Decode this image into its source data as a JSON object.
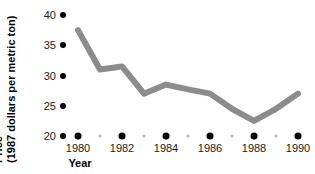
{
  "chart_data": {
    "type": "line",
    "title": "",
    "xlabel": "Year",
    "ylabel": "Price (1987 dollars per metric ton)",
    "ylabel_lines": [
      "Price",
      "(1987 dollars per metric ton)"
    ],
    "x": [
      1980,
      1981,
      1982,
      1983,
      1984,
      1985,
      1986,
      1987,
      1988,
      1989,
      1990
    ],
    "values": [
      37.5,
      31.0,
      31.5,
      27.0,
      28.5,
      27.7,
      27.0,
      24.5,
      22.5,
      24.5,
      27.0
    ],
    "series": [
      {
        "name": "Price",
        "values": [
          37.5,
          31.0,
          31.5,
          27.0,
          28.5,
          27.7,
          27.0,
          24.5,
          22.5,
          24.5,
          27.0
        ],
        "color": "#8c8c8c"
      }
    ],
    "xlim": [
      1979.5,
      1990.5
    ],
    "ylim": [
      20,
      40
    ],
    "yticks": [
      20,
      25,
      30,
      35,
      40
    ],
    "ytick_labels": [
      "20",
      "25",
      "30",
      "35",
      "40"
    ],
    "xticks": [
      1980,
      1981,
      1982,
      1983,
      1984,
      1985,
      1986,
      1987,
      1988,
      1989,
      1990
    ],
    "xtick_labels_major": [
      "1980",
      "1982",
      "1984",
      "1986",
      "1988",
      "1990"
    ],
    "xticks_major": [
      1980,
      1982,
      1984,
      1986,
      1988,
      1990
    ],
    "xticks_minor": [
      1981,
      1983,
      1985,
      1987,
      1989
    ],
    "grid": false,
    "legend": false,
    "legend_position": "none",
    "marker_style": "dot-ticks",
    "line_color": "#8c8c8c",
    "tick_color_major": "#000000",
    "tick_color_minor": "#b3b3b3",
    "background": "#ffffff"
  }
}
